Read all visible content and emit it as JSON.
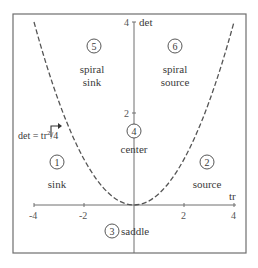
{
  "diagram": {
    "x_axis": {
      "label": "tr",
      "ticks": [
        "-4",
        "-2",
        "2",
        "4"
      ],
      "range": [
        -4,
        4
      ]
    },
    "y_axis": {
      "label": "det",
      "ticks": [
        "2",
        "4"
      ],
      "range": [
        0,
        4
      ]
    },
    "curve": {
      "equation": "det = tr²/4",
      "label_main": "det = tr",
      "label_sup": "2",
      "label_tail": "/4",
      "style": "dashed"
    },
    "regions": [
      {
        "number": "1",
        "name": "sink"
      },
      {
        "number": "2",
        "name": "source"
      },
      {
        "number": "3",
        "name": "saddle"
      },
      {
        "number": "4",
        "name": "center"
      },
      {
        "number": "5",
        "name_line1": "spiral",
        "name_line2": "sink"
      },
      {
        "number": "6",
        "name_line1": "spiral",
        "name_line2": "source"
      }
    ]
  },
  "colors": {
    "frame": "#6e6e6e",
    "axis": "#6e6e6e",
    "curve": "#555555",
    "text": "#3a3a3a"
  }
}
